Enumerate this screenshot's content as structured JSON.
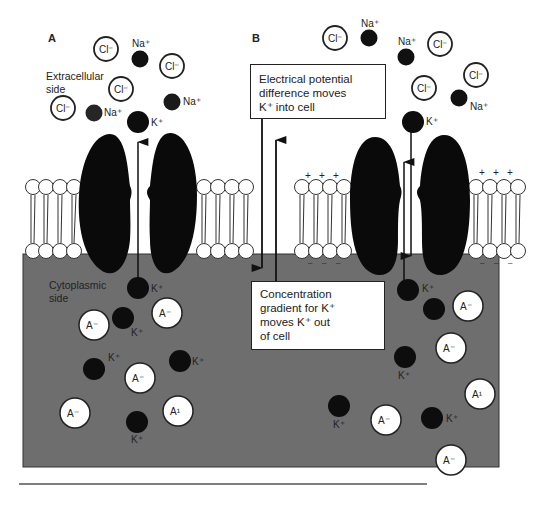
{
  "panels": [
    {
      "id": "A",
      "label": "A"
    },
    {
      "id": "B",
      "label": "B"
    }
  ],
  "labels": {
    "extracellular": [
      "Extracellular",
      "side"
    ],
    "cytoplasmic": [
      "Cytoplasmic",
      "side"
    ]
  },
  "boxes": {
    "electrical": [
      "Electrical potential",
      "difference moves",
      "K⁺ into cell"
    ],
    "concentration": [
      "Concentration",
      "gradient for K⁺",
      "moves K⁺ out",
      "of cell"
    ]
  },
  "ions": {
    "cl": "Cl⁻",
    "na": "Na⁺",
    "k": "K⁺",
    "a": "A⁻",
    "a_alt": "A¹"
  },
  "charges": {
    "plus": "+",
    "minus": "–"
  },
  "colors": {
    "cytoplasm": "#6f6f6f",
    "ion_dark": "#0d0d0d",
    "na_dark": "#1e1e1e",
    "channel": "#0a0a0a",
    "membrane_head": "#ffffff",
    "outline": "#222222"
  }
}
